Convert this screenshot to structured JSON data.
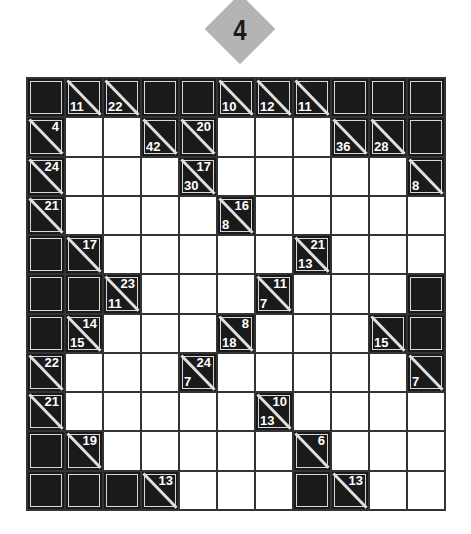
{
  "puzzle": {
    "number": "4",
    "badge_color": "#b4b4b4",
    "rows": 11,
    "cols": 11,
    "legend": {
      "B": "black block",
      "W": "white entry cell",
      "C": "clue cell: r = across sum (top-right), d = down sum (bottom-left)"
    },
    "grid": [
      [
        {
          "t": "B"
        },
        {
          "t": "C",
          "d": "11"
        },
        {
          "t": "C",
          "d": "22"
        },
        {
          "t": "B"
        },
        {
          "t": "B"
        },
        {
          "t": "C",
          "d": "10"
        },
        {
          "t": "C",
          "d": "12"
        },
        {
          "t": "C",
          "d": "11"
        },
        {
          "t": "B"
        },
        {
          "t": "B"
        },
        {
          "t": "B"
        }
      ],
      [
        {
          "t": "C",
          "r": "4"
        },
        {
          "t": "W"
        },
        {
          "t": "W"
        },
        {
          "t": "C",
          "d": "42"
        },
        {
          "t": "C",
          "r": "20"
        },
        {
          "t": "W"
        },
        {
          "t": "W"
        },
        {
          "t": "W"
        },
        {
          "t": "C",
          "d": "36"
        },
        {
          "t": "C",
          "d": "28"
        },
        {
          "t": "B"
        }
      ],
      [
        {
          "t": "C",
          "r": "24"
        },
        {
          "t": "W"
        },
        {
          "t": "W"
        },
        {
          "t": "W"
        },
        {
          "t": "C",
          "r": "17",
          "d": "30"
        },
        {
          "t": "W"
        },
        {
          "t": "W"
        },
        {
          "t": "W"
        },
        {
          "t": "W"
        },
        {
          "t": "W"
        },
        {
          "t": "C",
          "d": "8"
        }
      ],
      [
        {
          "t": "C",
          "r": "21"
        },
        {
          "t": "W"
        },
        {
          "t": "W"
        },
        {
          "t": "W"
        },
        {
          "t": "W"
        },
        {
          "t": "C",
          "r": "16",
          "d": "8"
        },
        {
          "t": "W"
        },
        {
          "t": "W"
        },
        {
          "t": "W"
        },
        {
          "t": "W"
        },
        {
          "t": "W"
        }
      ],
      [
        {
          "t": "B"
        },
        {
          "t": "C",
          "r": "17"
        },
        {
          "t": "W"
        },
        {
          "t": "W"
        },
        {
          "t": "W"
        },
        {
          "t": "W"
        },
        {
          "t": "W"
        },
        {
          "t": "C",
          "r": "21",
          "d": "13"
        },
        {
          "t": "W"
        },
        {
          "t": "W"
        },
        {
          "t": "W"
        }
      ],
      [
        {
          "t": "B"
        },
        {
          "t": "B"
        },
        {
          "t": "C",
          "r": "23",
          "d": "11"
        },
        {
          "t": "W"
        },
        {
          "t": "W"
        },
        {
          "t": "W"
        },
        {
          "t": "C",
          "r": "11",
          "d": "7"
        },
        {
          "t": "W"
        },
        {
          "t": "W"
        },
        {
          "t": "W"
        },
        {
          "t": "B"
        }
      ],
      [
        {
          "t": "B"
        },
        {
          "t": "C",
          "r": "14",
          "d": "15"
        },
        {
          "t": "W"
        },
        {
          "t": "W"
        },
        {
          "t": "W"
        },
        {
          "t": "C",
          "r": "8",
          "d": "18"
        },
        {
          "t": "W"
        },
        {
          "t": "W"
        },
        {
          "t": "W"
        },
        {
          "t": "C",
          "d": "15"
        },
        {
          "t": "B"
        }
      ],
      [
        {
          "t": "C",
          "r": "22"
        },
        {
          "t": "W"
        },
        {
          "t": "W"
        },
        {
          "t": "W"
        },
        {
          "t": "C",
          "r": "24",
          "d": "7"
        },
        {
          "t": "W"
        },
        {
          "t": "W"
        },
        {
          "t": "W"
        },
        {
          "t": "W"
        },
        {
          "t": "W"
        },
        {
          "t": "C",
          "d": "7"
        }
      ],
      [
        {
          "t": "C",
          "r": "21"
        },
        {
          "t": "W"
        },
        {
          "t": "W"
        },
        {
          "t": "W"
        },
        {
          "t": "W"
        },
        {
          "t": "W"
        },
        {
          "t": "C",
          "r": "10",
          "d": "13"
        },
        {
          "t": "W"
        },
        {
          "t": "W"
        },
        {
          "t": "W"
        },
        {
          "t": "W"
        }
      ],
      [
        {
          "t": "B"
        },
        {
          "t": "C",
          "r": "19"
        },
        {
          "t": "W"
        },
        {
          "t": "W"
        },
        {
          "t": "W"
        },
        {
          "t": "W"
        },
        {
          "t": "W"
        },
        {
          "t": "C",
          "r": "6"
        },
        {
          "t": "W"
        },
        {
          "t": "W"
        },
        {
          "t": "W"
        }
      ],
      [
        {
          "t": "B"
        },
        {
          "t": "B"
        },
        {
          "t": "B"
        },
        {
          "t": "C",
          "r": "13"
        },
        {
          "t": "W"
        },
        {
          "t": "W"
        },
        {
          "t": "W"
        },
        {
          "t": "B"
        },
        {
          "t": "C",
          "r": "13"
        },
        {
          "t": "W"
        },
        {
          "t": "W"
        }
      ]
    ]
  }
}
